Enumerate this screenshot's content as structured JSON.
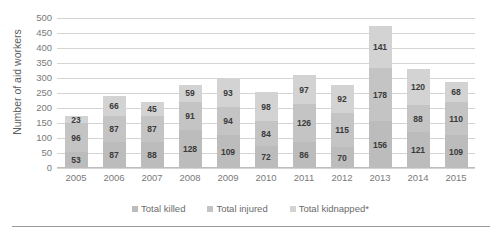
{
  "chart_data": {
    "type": "bar",
    "subtype": "stacked-column",
    "title": "",
    "xlabel": "",
    "ylabel": "Number of aid workers",
    "ylim": [
      0,
      500
    ],
    "ytick_step": 50,
    "yticks": [
      500,
      450,
      400,
      350,
      300,
      250,
      200,
      150,
      100,
      50,
      0
    ],
    "grid": true,
    "legend_position": "bottom",
    "categories": [
      "2005",
      "2006",
      "2007",
      "2008",
      "2009",
      "2010",
      "2011",
      "2012",
      "2013",
      "2014",
      "2015"
    ],
    "series": [
      {
        "name": "Total killed",
        "color": "#bcbcbc",
        "values": [
          53,
          87,
          88,
          128,
          109,
          72,
          86,
          70,
          156,
          121,
          109
        ]
      },
      {
        "name": "Total injured",
        "color": "#c4c4c4",
        "values": [
          96,
          87,
          87,
          91,
          94,
          84,
          126,
          115,
          178,
          88,
          110
        ]
      },
      {
        "name": "Total kidnapped*",
        "color": "#d3d3d3",
        "values": [
          23,
          66,
          45,
          59,
          93,
          98,
          97,
          92,
          141,
          120,
          68
        ]
      }
    ],
    "totals": [
      172,
      240,
      220,
      278,
      296,
      254,
      309,
      277,
      475,
      329,
      287
    ]
  },
  "legend": {
    "items": [
      {
        "label": "Total killed"
      },
      {
        "label": "Total injured"
      },
      {
        "label": "Total kidnapped*"
      }
    ]
  }
}
